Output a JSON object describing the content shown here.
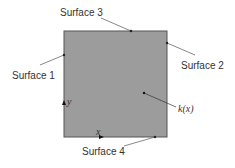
{
  "diagram": {
    "labels": {
      "surface1": "Surface 1",
      "surface2": "Surface 2",
      "surface3": "Surface 3",
      "surface4": "Surface 4",
      "conductivity": "k(x)",
      "x_axis": "x",
      "y_axis": "y"
    },
    "colors": {
      "fill": "#9c9c9c",
      "border": "#555555",
      "leader": "#555555"
    }
  }
}
